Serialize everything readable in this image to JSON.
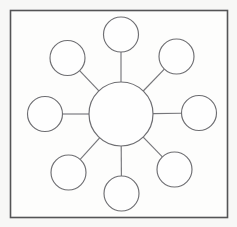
{
  "canvas": {
    "width": 237,
    "height": 227,
    "background_color": "#f7f7f6"
  },
  "frame": {
    "name": "diagram-border",
    "x": 10.5,
    "y": 10.5,
    "width": 217,
    "height": 207,
    "fill_color": "#fdfdfc",
    "stroke_color": "#545456",
    "stroke_width": 1.6
  },
  "diagram": {
    "type": "hub-and-spoke",
    "title": "",
    "node_fill_color": "#fefefe",
    "node_stroke_color": "#6e6e72",
    "spoke_stroke_color": "#76767a",
    "spoke_stroke_width": 1.15,
    "hub": {
      "label": "",
      "cx": 121,
      "cy": 114,
      "r": 32
    },
    "satellite_radius": 17.5,
    "spoke_count": 8,
    "satellites": [
      {
        "label": "",
        "position": "north",
        "angle_deg": 270,
        "cx": 121.0,
        "cy": 34.5
      },
      {
        "label": "",
        "position": "north-east",
        "angle_deg": 315,
        "cx": 176.5,
        "cy": 56.5
      },
      {
        "label": "",
        "position": "east",
        "angle_deg": 0,
        "cx": 199.0,
        "cy": 113.0
      },
      {
        "label": "",
        "position": "south-east",
        "angle_deg": 45,
        "cx": 174.5,
        "cy": 169.5
      },
      {
        "label": "",
        "position": "south",
        "angle_deg": 90,
        "cx": 121.5,
        "cy": 193.5
      },
      {
        "label": "",
        "position": "south-west",
        "angle_deg": 135,
        "cx": 68.5,
        "cy": 172.5
      },
      {
        "label": "",
        "position": "west",
        "angle_deg": 180,
        "cx": 45.0,
        "cy": 114.0
      },
      {
        "label": "",
        "position": "north-west",
        "angle_deg": 225,
        "cx": 67.5,
        "cy": 58.0
      }
    ]
  }
}
